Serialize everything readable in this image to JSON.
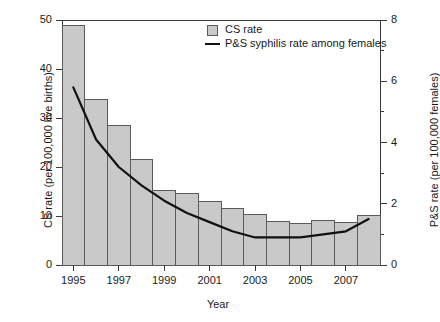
{
  "chart_data": {
    "type": "bar",
    "title": "",
    "xlabel": "Year",
    "ylabel": "CS rate (per 100,000 live births)",
    "ylabel_right": "P&S rate (per 100,000 females)",
    "categories": [
      "1995",
      "1996",
      "1997",
      "1998",
      "1999",
      "2000",
      "2001",
      "2002",
      "2003",
      "2004",
      "2005",
      "2006",
      "2007",
      "2008"
    ],
    "xtick_labels": [
      "1995",
      "1997",
      "1999",
      "2001",
      "2003",
      "2005",
      "2007"
    ],
    "ytick_labels_left": [
      "50",
      "40",
      "30",
      "20",
      "10",
      "0"
    ],
    "ytick_labels_right": [
      "8",
      "6",
      "4",
      "2",
      "0"
    ],
    "ylim": [
      0,
      50
    ],
    "ylim_right": [
      0,
      8
    ],
    "grid": false,
    "legend_position": "top-right",
    "series": [
      {
        "name": "CS rate",
        "kind": "bar",
        "axis": "left",
        "values": [
          48.8,
          33.8,
          28.4,
          21.6,
          15.3,
          14.6,
          13.0,
          11.5,
          10.3,
          8.8,
          8.4,
          9.0,
          8.6,
          10.2
        ]
      },
      {
        "name": "P&S syphilis rate among females",
        "kind": "line",
        "axis": "right",
        "values": [
          5.8,
          4.1,
          3.2,
          2.6,
          2.1,
          1.7,
          1.4,
          1.1,
          0.9,
          0.9,
          0.9,
          1.0,
          1.1,
          1.5
        ]
      }
    ],
    "colors": {
      "bar_fill": "#c9c9c9",
      "bar_edge": "#5a5a5a",
      "line": "#111111",
      "axis": "#3a3a3a",
      "background": "#ffffff"
    }
  },
  "legend": {
    "items": [
      {
        "label": "CS rate",
        "marker": "square-swatch"
      },
      {
        "label": "P&S syphilis rate among females",
        "marker": "line-swatch"
      }
    ]
  }
}
